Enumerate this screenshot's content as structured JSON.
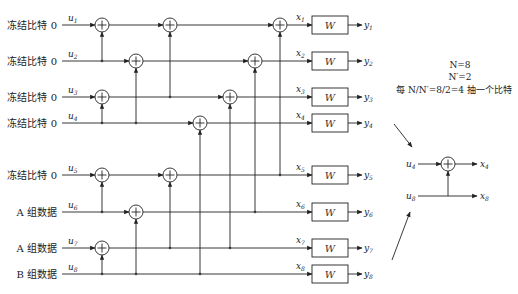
{
  "diagram": {
    "inputs": [
      {
        "label": "冻结比特 0",
        "var": "u",
        "idx": "1",
        "y": 25
      },
      {
        "label": "冻结比特 0",
        "var": "u",
        "idx": "2",
        "y": 61
      },
      {
        "label": "冻结比特 0",
        "var": "u",
        "idx": "3",
        "y": 97
      },
      {
        "label": "冻结比特 0",
        "var": "u",
        "idx": "4",
        "y": 123
      },
      {
        "label": "冻结比特 0",
        "var": "u",
        "idx": "5",
        "y": 175
      },
      {
        "label": "A 组数据",
        "var": "u",
        "idx": "6",
        "y": 212
      },
      {
        "label": "A 组数据",
        "var": "u",
        "idx": "7",
        "y": 248
      },
      {
        "label": "B 组数据",
        "var": "u",
        "idx": "8",
        "y": 274
      }
    ],
    "encoded": [
      {
        "var": "x",
        "idx": "1"
      },
      {
        "var": "x",
        "idx": "2"
      },
      {
        "var": "x",
        "idx": "3"
      },
      {
        "var": "x",
        "idx": "4"
      },
      {
        "var": "x",
        "idx": "5"
      },
      {
        "var": "x",
        "idx": "6"
      },
      {
        "var": "x",
        "idx": "7"
      },
      {
        "var": "x",
        "idx": "8"
      }
    ],
    "channel_label": "W",
    "outputs": [
      {
        "var": "y",
        "idx": "1"
      },
      {
        "var": "y",
        "idx": "2"
      },
      {
        "var": "y",
        "idx": "3"
      },
      {
        "var": "y",
        "idx": "4"
      },
      {
        "var": "y",
        "idx": "5"
      },
      {
        "var": "y",
        "idx": "6"
      },
      {
        "var": "y",
        "idx": "7"
      },
      {
        "var": "y",
        "idx": "8"
      }
    ],
    "note": {
      "line1": "N=8",
      "line2": "N′=2",
      "line3": "每 N/N′=8/2=4 抽一个比特"
    },
    "subcode": {
      "in_top": {
        "var": "u",
        "idx": "4"
      },
      "in_bottom": {
        "var": "u",
        "idx": "8"
      },
      "out_top": {
        "var": "x",
        "idx": "4"
      },
      "out_bottom": {
        "var": "x",
        "idx": "8"
      }
    }
  }
}
